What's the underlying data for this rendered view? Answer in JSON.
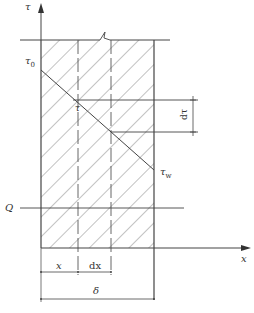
{
  "figure": {
    "type": "shear stress distribution across layer thickness",
    "labels": {
      "tau_axis": "τ",
      "x_axis": "x",
      "tau0_main": "τ",
      "tau0_sub": "0",
      "tau": "τ",
      "tauw_main": "τ",
      "tauw_sub": "w",
      "dtau": "dτ",
      "Q": "Q",
      "x_dim": "x",
      "dx_dim": "dx",
      "delta_dim": "δ"
    },
    "colors": {
      "line": "#444444",
      "hatch": "#666666",
      "background": "#ffffff"
    }
  }
}
